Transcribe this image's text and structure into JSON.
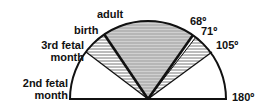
{
  "labels": {
    "adult": "adult",
    "birth": "birth",
    "third_line1": "3rd fetal",
    "third_line2": "month",
    "second_line1": "2nd fetal",
    "second_line2": "month",
    "deg68": "68º",
    "deg71": "71º",
    "deg105": "105º",
    "deg180": "180º"
  },
  "colors": {
    "line": "#111111",
    "shade": "#c8c8c8",
    "hatch": "#555555"
  }
}
